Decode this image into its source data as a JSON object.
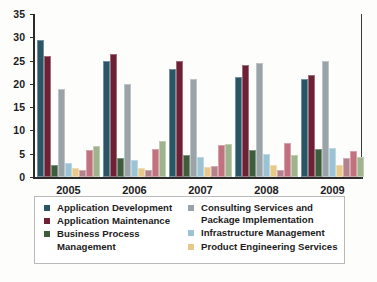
{
  "chart_data": {
    "type": "bar",
    "title": "",
    "subtitle": "",
    "xlabel": "",
    "ylabel": "",
    "categories": [
      "2005",
      "2006",
      "2007",
      "2008",
      "2009"
    ],
    "ylim": [
      0,
      35
    ],
    "yticks": [
      0,
      5,
      10,
      15,
      20,
      25,
      30,
      35
    ],
    "grid": false,
    "legend_position": "bottom",
    "series": [
      {
        "name": "Application Development",
        "color": "#2a5567",
        "values": [
          29.5,
          25.0,
          23.2,
          21.5,
          21.0
        ]
      },
      {
        "name": "Application Maintenance",
        "color": "#6e2034",
        "values": [
          26.0,
          26.5,
          25.0,
          24.0,
          22.0
        ]
      },
      {
        "name": "Business Process Management",
        "color": "#3c5c3c",
        "values": [
          2.6,
          4.0,
          4.7,
          5.7,
          6.0
        ]
      },
      {
        "name": "Consulting Services and Package Implementation",
        "color": "#9aa3a8",
        "values": [
          19.0,
          20.0,
          21.0,
          24.5,
          25.0
        ]
      },
      {
        "name": "Infrastructure Management",
        "color": "#9bc3d4",
        "values": [
          3.1,
          3.6,
          4.4,
          5.0,
          6.3
        ]
      },
      {
        "name": "Product Engineering Services",
        "color": "#e8c98a",
        "values": [
          2.0,
          2.0,
          2.2,
          2.6,
          2.6
        ]
      },
      {
        "name": "",
        "color": "#b4818f",
        "values": [
          1.5,
          1.6,
          2.3,
          1.6,
          4.0
        ]
      },
      {
        "name": "",
        "color": "#c2727f",
        "values": [
          5.8,
          6.0,
          6.8,
          7.2,
          5.5
        ]
      },
      {
        "name": "",
        "color": "#9fb48c",
        "values": [
          6.6,
          7.8,
          7.0,
          4.8,
          4.2
        ]
      }
    ]
  },
  "axis": {
    "y_tick_labels": [
      "35",
      "30",
      "25",
      "20",
      "15",
      "10",
      "5",
      "0"
    ],
    "x_tick_labels": [
      "2005",
      "2006",
      "2007",
      "2008",
      "2009"
    ]
  },
  "legend": {
    "left_column": [
      {
        "label": "Application Development",
        "color": "#2a5567"
      },
      {
        "label": "Application Maintenance",
        "color": "#6e2034"
      },
      {
        "label": "Business Process Management",
        "color": "#3c5c3c"
      }
    ],
    "right_column": [
      {
        "label": "Consulting Services and Package Implementation",
        "color": "#9aa3a8"
      },
      {
        "label": "Infrastructure Management",
        "color": "#9bc3d4"
      },
      {
        "label": "Product Engineering Services",
        "color": "#e8c98a"
      }
    ]
  }
}
